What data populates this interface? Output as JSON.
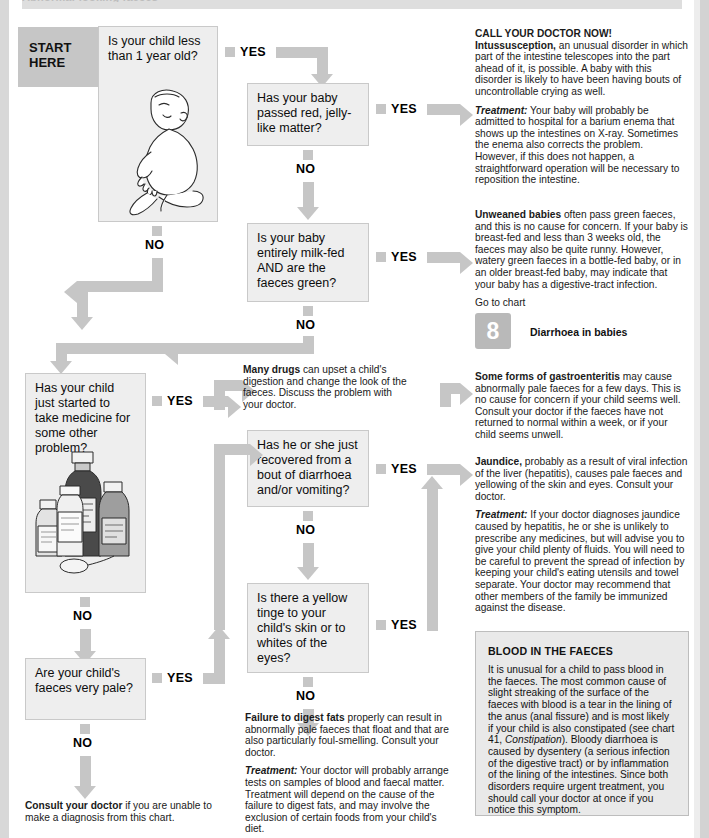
{
  "page": {
    "title_band_ghost": "Abnormal-looking faeces",
    "start_label_line1": "START",
    "start_label_line2": "HERE"
  },
  "labels": {
    "yes": "YES",
    "no": "NO"
  },
  "questions": {
    "q1": "Is your child less than 1 year old?",
    "q2": "Has your baby passed red, jelly-like matter?",
    "q3": "Is your baby entirely milk-fed AND are the faeces green?",
    "q4": "Has your child just started to take medicine for some other problem?",
    "q5": "Has he or she just recovered from a bout of diarrhoea and/or vomiting?",
    "q6": "Is there a yellow tinge to your child's skin or to whites of the eyes?",
    "q7": "Are your child's faeces very pale?"
  },
  "answers": {
    "intussusception": {
      "alert": "CALL YOUR DOCTOR NOW!",
      "term": "Intussusception,",
      "body": " an unusual disorder in which part of the intestine telescopes into the part ahead of it, is possible. A baby with this disorder is likely to have been having bouts of uncontrollable crying as well.",
      "treatment_label": "Treatment:",
      "treatment_body": " Your baby will probably be admitted to hospital for a barium enema that shows up the intestines on X-ray. Sometimes the enema also corrects the problem. However, if this does not happen, a straightforward operation will be necessary to reposition the intestine."
    },
    "unweaned": {
      "term": "Unweaned babies",
      "body": " often pass green faeces, and this is no cause for concern. If your baby is breast-fed and less than 3 weeks old, the faeces may also be quite runny. However, watery green faeces in a bottle-fed baby, or in an older breast-fed baby, may indicate that your baby has a digestive-tract infection.",
      "goto": "Go to chart",
      "chart_number": "8",
      "chart_title": "Diarrhoea in babies"
    },
    "many_drugs": {
      "term": "Many drugs",
      "body": " can upset a child's digestion and change the look of the faeces. Discuss the problem with your doctor."
    },
    "gastroenteritis": {
      "term": "Some forms of gastroenteritis",
      "body": " may cause abnormally pale faeces for a few days. This is no cause for concern if your child seems well. Consult your doctor if the faeces have not returned to normal within a week, or if your child seems unwell."
    },
    "jaundice": {
      "term": "Jaundice,",
      "body": " probably as a result of viral infection of the liver (hepatitis), causes pale faeces and yellowing of the skin and eyes. Consult your doctor.",
      "treatment_label": "Treatment:",
      "treatment_body": " If your doctor diagnoses jaundice caused by hepatitis, he or she is unlikely to prescribe any medicines, but will advise you to give your child plenty of fluids. You will need to be careful to prevent the spread of infection by keeping your child's eating utensils and towel separate. Your doctor may recommend that other members of the family be immunized against the disease."
    },
    "digest_fats": {
      "term": "Failure to digest fats",
      "body": " properly can result in abnormally pale faeces that float and that are also particularly foul-smelling. Consult your doctor.",
      "treatment_label": "Treatment:",
      "treatment_body": " Your doctor will probably arrange tests on samples of blood and faecal matter. Treatment will depend on the cause of the failure to digest fats, and may involve the exclusion of certain foods from your child's diet."
    },
    "footer": {
      "term": "Consult your doctor",
      "body": " if you are unable to make a diagnosis from this chart."
    }
  },
  "panel": {
    "heading": "BLOOD IN THE FAECES",
    "body_1": "It is unusual for a child to pass blood in the faeces. The most common cause of slight streaking of the surface of the faeces with blood is a tear in the lining of the anus (anal fissure) and is most likely if your child is also constipated (see chart 41, ",
    "italic_ref": "Constipation",
    "body_2": "). Bloody diarrhoea is caused by dysentery (a serious infection of the digestive tract) or by inflammation of the lining of the intestines. Since both disorders require urgent treatment, you should call your doctor at once if you notice this symptom."
  },
  "illustrations": {
    "baby": "baby-sitting-illustration",
    "medicines": "medicine-bottles-illustration"
  },
  "colors": {
    "arrow_grey": "#c6c6c6",
    "box_fill": "#eeeeee",
    "box_border": "#c9c9c9",
    "panel_fill": "#e9e9e9",
    "page_bg": "#ffffff"
  }
}
